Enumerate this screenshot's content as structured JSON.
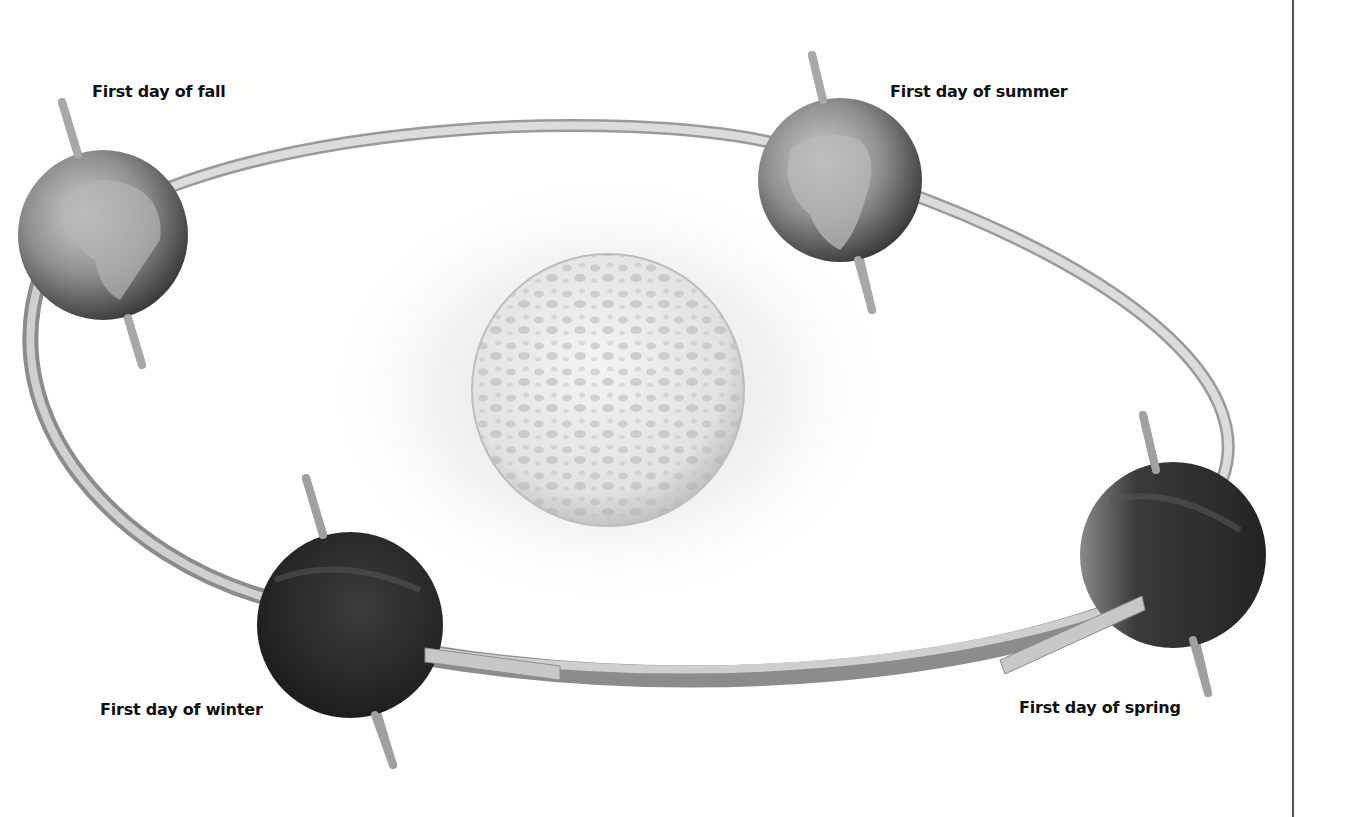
{
  "diagram": {
    "center": {
      "name": "Sun"
    },
    "orbit": {
      "shape": "ellipse"
    },
    "positions": [
      {
        "id": "fall",
        "label": "First day of fall",
        "shading": "lit"
      },
      {
        "id": "summer",
        "label": "First day of summer",
        "shading": "lit"
      },
      {
        "id": "spring",
        "label": "First day of spring",
        "shading": "dark"
      },
      {
        "id": "winter",
        "label": "First day of winter",
        "shading": "dark"
      }
    ]
  },
  "colors": {
    "text": "#111111",
    "orbit_top": "#d6d6d6",
    "orbit_side": "#9a9a9a",
    "axis": "#b0b0b0",
    "earth_dark": "#2a2a2a",
    "earth_land": "#bdbdbd",
    "sun_light": "#f2f2f2",
    "sun_spots": "#b8b8b8",
    "divider": "#555555"
  }
}
